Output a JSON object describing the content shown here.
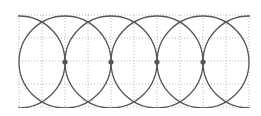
{
  "diagram": {
    "title": "",
    "canvas": {
      "width": 261,
      "height": 116
    },
    "grid": {
      "x0": 19,
      "y0": 15,
      "cols": 10,
      "rows": 4,
      "cell": 23,
      "color": "#b8b8b8",
      "style": "dotted"
    },
    "circles": {
      "radius": 46,
      "cy": 62,
      "centers_x": [
        19,
        65,
        111,
        157,
        203,
        249
      ],
      "stroke": "#555555",
      "stroke_width": 1.3
    },
    "points": {
      "cy": 62,
      "xs": [
        65,
        111,
        157,
        203
      ],
      "radius": 2.6,
      "fill": "#555555"
    }
  }
}
